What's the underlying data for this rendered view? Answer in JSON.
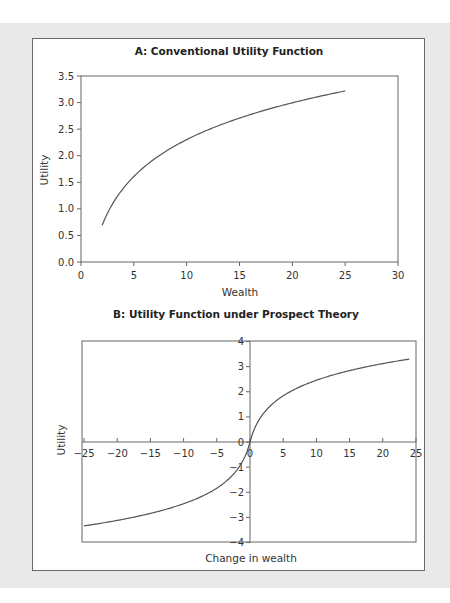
{
  "chart_data": [
    {
      "type": "line",
      "title": "A: Conventional Utility Function",
      "xlabel": "Wealth",
      "ylabel": "Utility",
      "xlim": [
        0,
        30
      ],
      "ylim": [
        0,
        3.5
      ],
      "xticks": [
        "0",
        "5",
        "10",
        "15",
        "20",
        "25",
        "30"
      ],
      "yticks": [
        "0.0",
        "0.5",
        "1.0",
        "1.5",
        "2.0",
        "2.5",
        "3.0",
        "3.5"
      ],
      "grid": false,
      "series": [
        {
          "name": "Utility",
          "x": [
            2,
            3,
            4,
            5,
            6,
            8,
            10,
            12,
            15,
            18,
            20,
            22,
            25
          ],
          "y": [
            0.69,
            1.1,
            1.39,
            1.61,
            1.79,
            2.08,
            2.3,
            2.48,
            2.71,
            2.89,
            3.0,
            3.09,
            3.22
          ]
        }
      ],
      "color": "#555555"
    },
    {
      "type": "line",
      "title": "B: Utility Function under Prospect Theory",
      "xlabel": "Change in wealth",
      "ylabel": "Utility",
      "xlim": [
        -25,
        25
      ],
      "ylim": [
        -4,
        4
      ],
      "xticks": [
        "−25",
        "−20",
        "−15",
        "−10",
        "−5",
        "0",
        "5",
        "10",
        "15",
        "20",
        "25"
      ],
      "yticks": [
        "−4",
        "−3",
        "−2",
        "−1",
        "0",
        "1",
        "2",
        "3",
        "4"
      ],
      "grid": false,
      "series": [
        {
          "name": "Utility",
          "x": [
            -25,
            -20,
            -15,
            -10,
            -5,
            -3,
            -2,
            -1,
            -0.5,
            0,
            0.5,
            1,
            2,
            3,
            5,
            10,
            15,
            20,
            24
          ],
          "y": [
            -3.35,
            -3.1,
            -2.8,
            -2.45,
            -1.85,
            -1.45,
            -1.15,
            -0.72,
            -0.42,
            0,
            0.42,
            0.72,
            1.15,
            1.45,
            1.85,
            2.45,
            2.8,
            3.1,
            3.3
          ]
        }
      ],
      "color": "#555555"
    }
  ]
}
